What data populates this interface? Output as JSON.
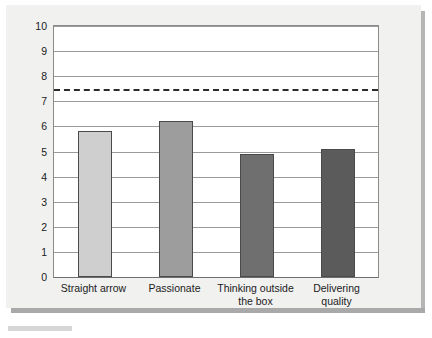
{
  "chart_data": {
    "type": "bar",
    "title": "",
    "subtitle": "",
    "xlabel": "",
    "ylabel": "",
    "ylim": [
      0,
      10
    ],
    "ytick_step": 1,
    "yticks": [
      "10",
      "9",
      "8",
      "7",
      "6",
      "5",
      "4",
      "3",
      "2",
      "1",
      "0"
    ],
    "grid": true,
    "legend": "none",
    "categories": [
      "Straight arrow",
      "Passionate",
      "Thinking outside\nthe box",
      "Delivering\nquality"
    ],
    "values": [
      5.8,
      6.2,
      4.9,
      5.1
    ],
    "bar_colors": [
      "#cfcfcf",
      "#9d9d9d",
      "#6f6f6f",
      "#5b5b5b"
    ],
    "bar_border_color": "#4a4a4a",
    "annotations": [
      {
        "name": "threshold-line",
        "type": "horizontal-reference-line",
        "value": 7.5,
        "style": "dashed",
        "color": "#2b2b2b"
      }
    ]
  },
  "colors": {
    "card_background": "#f1f1f0",
    "plot_background": "#ffffff",
    "plot_border": "#8a8a8a",
    "gridline": "#9a9a9a",
    "axis": "#6e6e6e",
    "text": "#1b1b1b",
    "shadow": "#b6b6b6"
  }
}
